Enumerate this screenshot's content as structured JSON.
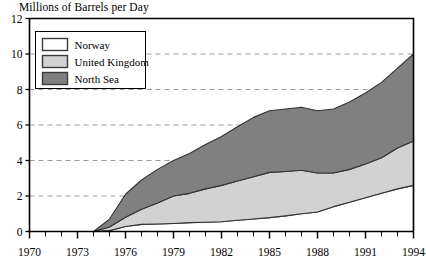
{
  "chart_data": {
    "type": "area",
    "stacked": true,
    "title": "Millions of Barrels per Day",
    "xlabel": "",
    "ylabel": "",
    "xlim": [
      1970,
      1994
    ],
    "ylim": [
      0,
      12
    ],
    "yticks": [
      0,
      2,
      4,
      6,
      8,
      10,
      12
    ],
    "xticks": [
      1970,
      1973,
      1976,
      1979,
      1982,
      1985,
      1988,
      1991,
      1994
    ],
    "xtick_all": [
      1970,
      1971,
      1972,
      1973,
      1974,
      1975,
      1976,
      1977,
      1978,
      1979,
      1980,
      1981,
      1982,
      1983,
      1984,
      1985,
      1986,
      1987,
      1988,
      1989,
      1990,
      1991,
      1992,
      1993,
      1994
    ],
    "grid": "horizontal-dashed",
    "legend_position": "top-left-inside",
    "x": [
      1970,
      1971,
      1972,
      1973,
      1974,
      1975,
      1976,
      1977,
      1978,
      1979,
      1980,
      1981,
      1982,
      1983,
      1984,
      1985,
      1986,
      1987,
      1988,
      1989,
      1990,
      1991,
      1992,
      1993,
      1994
    ],
    "series": [
      {
        "name": "Norway",
        "color": "#ffffff",
        "values": [
          0.0,
          0.0,
          0.0,
          0.0,
          0.0,
          0.05,
          0.28,
          0.4,
          0.42,
          0.45,
          0.5,
          0.52,
          0.55,
          0.63,
          0.7,
          0.78,
          0.88,
          1.0,
          1.1,
          1.4,
          1.65,
          1.9,
          2.15,
          2.4,
          2.6
        ]
      },
      {
        "name": "United Kingdom",
        "color": "#d2d2d2",
        "values": [
          0.0,
          0.0,
          0.0,
          0.0,
          0.0,
          0.2,
          0.52,
          0.85,
          1.18,
          1.55,
          1.65,
          1.88,
          2.05,
          2.22,
          2.38,
          2.55,
          2.5,
          2.45,
          2.2,
          1.9,
          1.85,
          1.9,
          2.0,
          2.3,
          2.5
        ]
      },
      {
        "name": "North Sea",
        "color": "#808080",
        "values": [
          0.0,
          0.0,
          0.0,
          0.0,
          0.0,
          0.45,
          1.3,
          1.65,
          1.9,
          2.0,
          2.25,
          2.5,
          2.75,
          3.05,
          3.35,
          3.47,
          3.52,
          3.55,
          3.5,
          3.6,
          3.8,
          4.0,
          4.25,
          4.5,
          4.9
        ]
      }
    ],
    "totals": [
      0.0,
      0.0,
      0.0,
      0.0,
      0.0,
      0.7,
      2.1,
      2.9,
      3.5,
      4.0,
      4.4,
      4.9,
      5.35,
      5.9,
      6.43,
      6.8,
      6.9,
      7.0,
      6.8,
      6.9,
      7.3,
      7.8,
      8.4,
      9.2,
      10.0
    ]
  },
  "legend": {
    "items": [
      {
        "label": "Norway",
        "color": "#ffffff"
      },
      {
        "label": "United Kingdom",
        "color": "#d2d2d2"
      },
      {
        "label": "North Sea",
        "color": "#808080"
      }
    ]
  }
}
